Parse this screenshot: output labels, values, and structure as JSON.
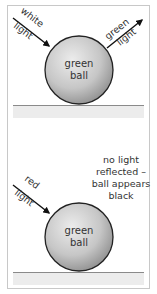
{
  "panels": [
    {
      "id": "top",
      "ball_label": [
        "green",
        "ball"
      ],
      "incoming_label": [
        "white",
        "light"
      ],
      "outgoing_label": [
        "green",
        "light"
      ],
      "note": []
    },
    {
      "id": "bottom",
      "ball_label": [
        "green",
        "ball"
      ],
      "incoming_label": [
        "red",
        "light"
      ],
      "outgoing_label": [],
      "note": [
        "no light",
        "reflected –",
        "ball appears",
        "black"
      ]
    }
  ],
  "colors": {
    "border": "#c8c8c8",
    "ground_line": "#8a8a8a",
    "floor": "#ececec",
    "ball_light": "#e4e4e4",
    "ball_dark": "#9a9a9a",
    "ball_outline": "#222222",
    "arrow": "#111111",
    "text": "#333333"
  }
}
